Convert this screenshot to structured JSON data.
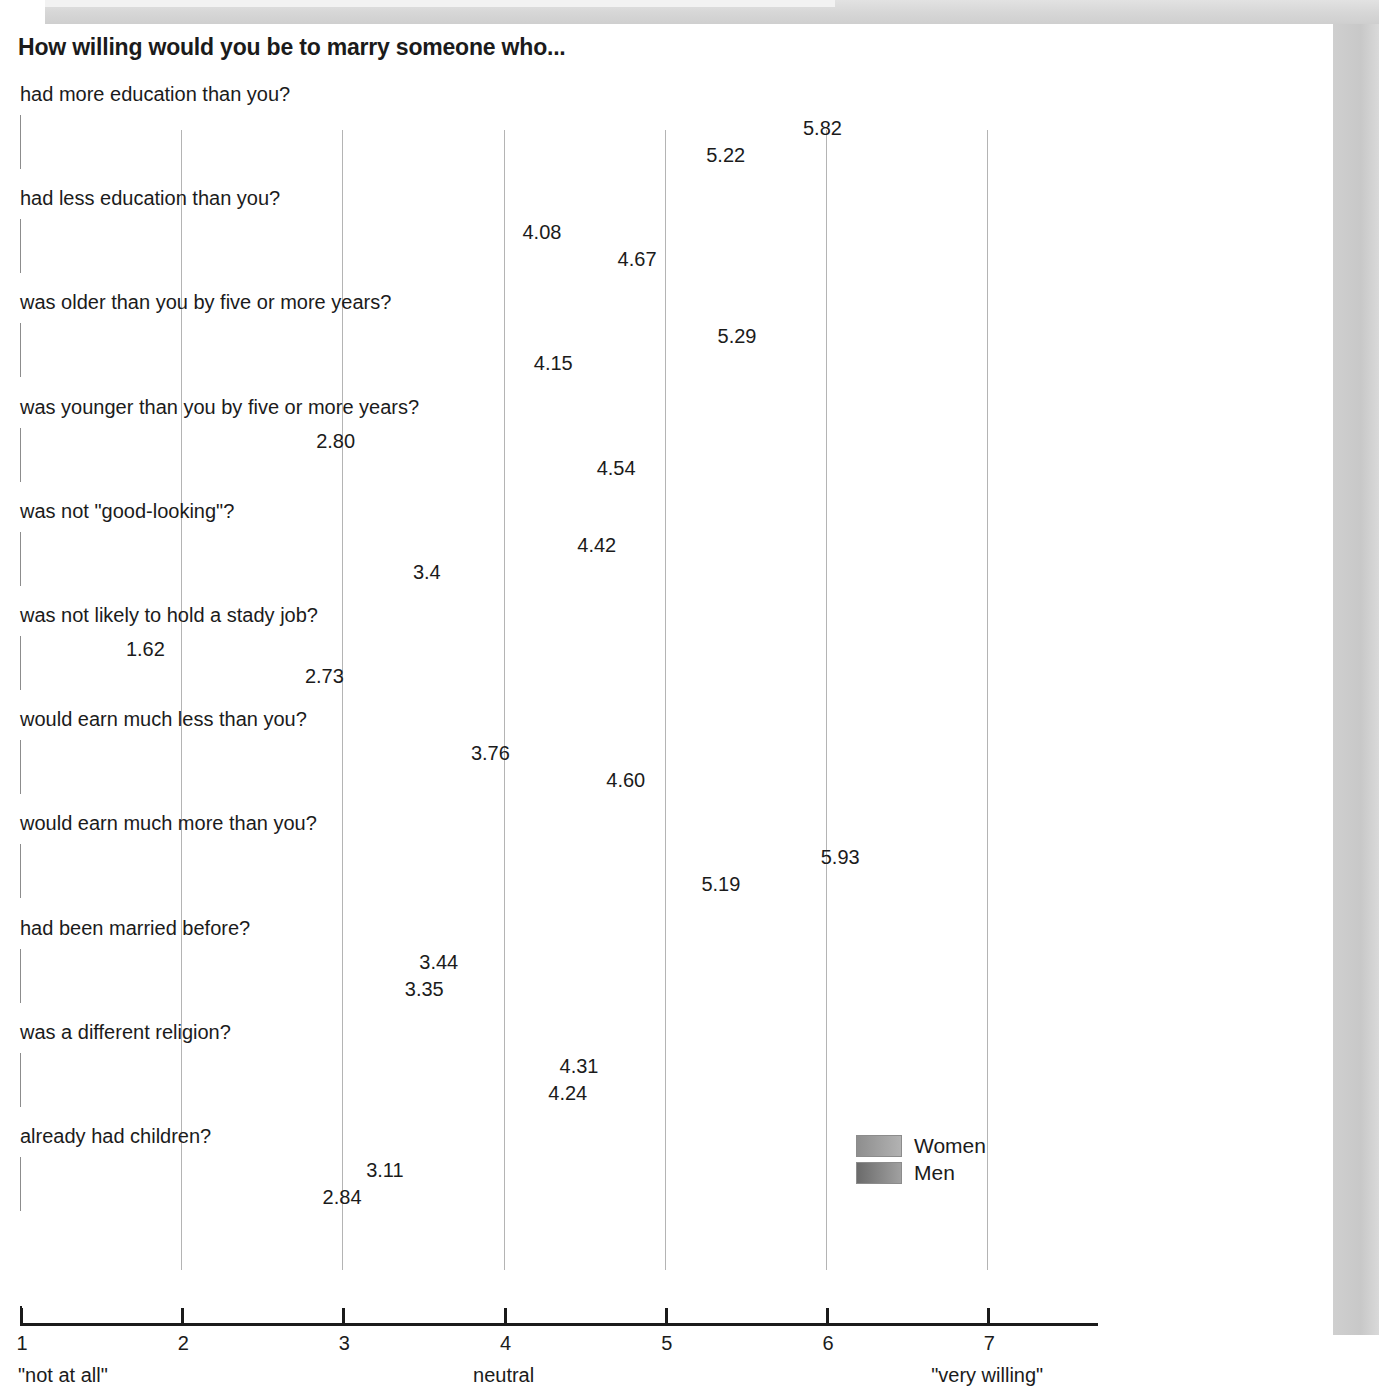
{
  "frame": {
    "shadow_color": "#cfcfcf",
    "page_color": "#ffffff"
  },
  "chart_data": {
    "type": "bar",
    "orientation": "horizontal",
    "title": "How willing would you be to marry someone who...",
    "xlabel": "",
    "ylabel": "",
    "xlim": [
      1,
      7
    ],
    "grid": true,
    "grid_axis": "x",
    "legend_position": "bottom-right",
    "tick_labels": [
      "1",
      "2",
      "3",
      "4",
      "5",
      "6",
      "7"
    ],
    "ticks": [
      1,
      2,
      3,
      4,
      5,
      6,
      7
    ],
    "scale_anchors": [
      {
        "value": 1,
        "text": "\"not at all\""
      },
      {
        "value": 4,
        "text": "neutral"
      },
      {
        "value": 7,
        "text": "\"very willing\""
      }
    ],
    "categories": [
      "had more education than you?",
      "had less education than you?",
      "was older than you by five or more years?",
      "was younger than you by five or more years?",
      "was not \"good-looking\"?",
      "was not likely to hold a stady job?",
      "would earn much less than you?",
      "would earn much more than you?",
      "had been married before?",
      "was a different religion?",
      "already had children?"
    ],
    "series": [
      {
        "name": "Women",
        "color": "#acacac",
        "values": [
          5.82,
          4.08,
          5.29,
          2.8,
          4.42,
          1.62,
          3.76,
          5.93,
          3.44,
          4.31,
          3.11
        ],
        "labels": [
          "5.82",
          "4.08",
          "5.29",
          "2.80",
          "4.42",
          "1.62",
          "3.76",
          "5.93",
          "3.44",
          "4.31",
          "3.11"
        ]
      },
      {
        "name": "Men",
        "color": "#939393",
        "values": [
          5.22,
          4.67,
          4.15,
          4.54,
          3.4,
          2.73,
          4.6,
          5.19,
          3.35,
          4.24,
          2.84
        ],
        "labels": [
          "5.22",
          "4.67",
          "4.15",
          "4.54",
          "3.4",
          "2.73",
          "4.60",
          "5.19",
          "3.35",
          "4.24",
          "2.84"
        ]
      }
    ]
  },
  "legend": {
    "items": [
      {
        "label": "Women"
      },
      {
        "label": "Men"
      }
    ]
  }
}
